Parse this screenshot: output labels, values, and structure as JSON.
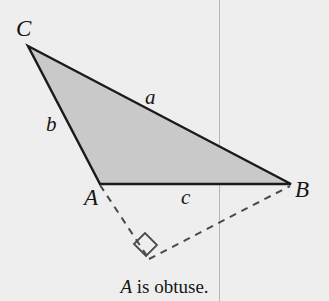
{
  "figure": {
    "kind": "geometry-diagram",
    "caption": {
      "subject": "A",
      "rest": " is obtuse."
    },
    "colors": {
      "background": "#eeeeee",
      "triangle_fill": "#c9c9c9",
      "stroke": "#1a1a1a",
      "dashed_stroke": "#4a4a4a",
      "guide_line": "#b6b6b6"
    },
    "vertices": [
      {
        "name": "C",
        "label": "C",
        "x": 28,
        "y": 46,
        "label_x": 16,
        "label_y": 36
      },
      {
        "name": "A",
        "label": "A",
        "x": 100,
        "y": 184,
        "label_x": 84,
        "label_y": 205
      },
      {
        "name": "B",
        "label": "B",
        "x": 291,
        "y": 184,
        "label_x": 295,
        "label_y": 197
      }
    ],
    "sides": [
      {
        "name": "a",
        "label": "a",
        "between": "C-B",
        "label_x": 145,
        "label_y": 104
      },
      {
        "name": "b",
        "label": "b",
        "between": "C-A",
        "label_x": 46,
        "label_y": 131
      },
      {
        "name": "c",
        "label": "c",
        "between": "A-B",
        "label_x": 181,
        "label_y": 204
      }
    ],
    "triangle_path": "M28,46 L291,184 L100,184 Z",
    "dashed_segments": [
      {
        "name": "altitude-foot-from-A",
        "x1": 100,
        "y1": 185,
        "x2": 149,
        "y2": 259
      },
      {
        "name": "altitude-from-B",
        "x1": 149,
        "y1": 259,
        "x2": 290,
        "y2": 186
      }
    ],
    "right_angle_marker": {
      "name": "right-angle-square",
      "points": "134,244 145,233 157,245 146,256"
    },
    "guide_line": {
      "name": "vertical-guide-line",
      "x": 219.5,
      "y1": 0,
      "y2": 301
    }
  }
}
